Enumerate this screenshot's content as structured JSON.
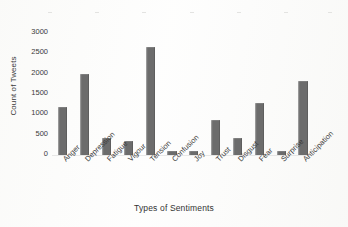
{
  "chart_data": {
    "type": "bar",
    "title": "",
    "xlabel": "Types of Sentiments",
    "ylabel": "Count of Tweets",
    "categories": [
      "Anger",
      "Depression",
      "Fatigue",
      "Vigour",
      "Tension",
      "Confusion",
      "Joy",
      "Trust",
      "Disgust",
      "Fear",
      "Surprise",
      "Anticipation"
    ],
    "values": [
      1180,
      1990,
      430,
      350,
      2650,
      110,
      90,
      870,
      430,
      1270,
      100,
      1830
    ],
    "ylim": [
      0,
      3000
    ],
    "yticks": [
      0,
      500,
      1000,
      1500,
      2000,
      2500,
      3000
    ],
    "ytick_labels": [
      "0",
      "500",
      "1000",
      "1500",
      "2000",
      "2500",
      "3000"
    ],
    "grid": false,
    "legend": false,
    "bar_color": "#6c6c6c",
    "background_color": "#fcfcfb"
  },
  "axis": {
    "y_title": "Count of Tweets",
    "x_title": "Types of Sentiments"
  }
}
